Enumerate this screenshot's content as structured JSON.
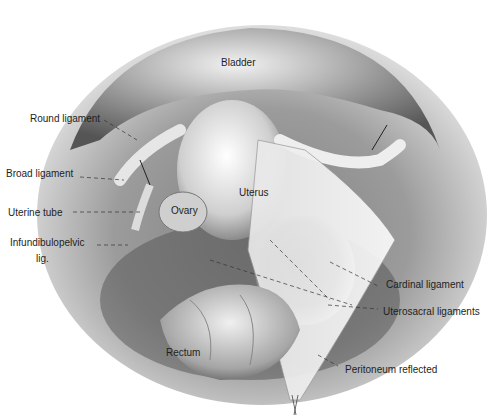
{
  "figure": {
    "type": "anatomical illustration",
    "style": "grayscale pencil drawing",
    "structures": {
      "bladder": "Bladder",
      "uterus": "Uterus",
      "ovary": "Ovary",
      "rectum": "Rectum"
    },
    "labels": {
      "round_ligament": "Round ligament",
      "broad_ligament": "Broad ligament",
      "uterine_tube": "Uterine tube",
      "infundibulopelvic_1": "Infundibulopelvic",
      "infundibulopelvic_2": "lig.",
      "cardinal_ligament": "Cardinal ligament",
      "uterosacral_ligaments": "Uterosacral ligaments",
      "peritoneum_reflected": "Peritoneum reflected"
    }
  }
}
